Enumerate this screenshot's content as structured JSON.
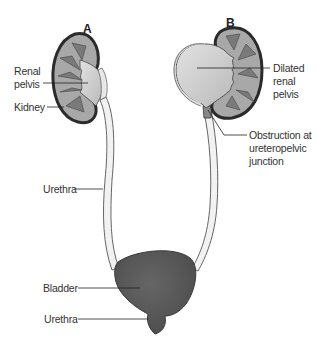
{
  "diagram": {
    "panels": {
      "a": {
        "letter": "A"
      },
      "b": {
        "letter": "B"
      }
    },
    "labels": {
      "renal_pelvis_line1": "Renal",
      "renal_pelvis_line2": "pelvis",
      "kidney": "Kidney",
      "dilated_line1": "Dilated",
      "dilated_line2": "renal",
      "dilated_line3": "pelvis",
      "obstruction_line1": "Obstruction at",
      "obstruction_line2": "ureteropelvic",
      "obstruction_line3": "junction",
      "urethra_upper": "Urethra",
      "bladder": "Bladder",
      "urethra_lower": "Urethra"
    },
    "colors": {
      "kidney_outline": "#2b2b2b",
      "cortex": "#a8a8a8",
      "pelvis_fill": "#cfcfcf",
      "bladder": "#555555",
      "ureter_fill": "#f2f2f2"
    }
  }
}
